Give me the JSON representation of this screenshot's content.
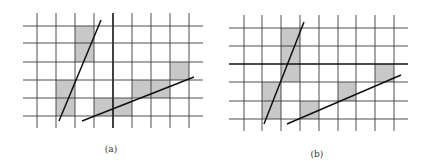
{
  "colors": {
    "grid": "#3a3a3a",
    "shade": "#c8c8c8",
    "line": "#111111"
  },
  "panels": [
    {
      "id": "a",
      "label": "(a)",
      "label_pos": [
        111,
        146
      ],
      "vlines": [
        37,
        56,
        75,
        94,
        113,
        132,
        151,
        170,
        189
      ],
      "vline_range": [
        13,
        128
      ],
      "hlines": [
        26,
        43,
        62,
        80,
        98,
        116
      ],
      "hline_range": [
        23,
        203
      ],
      "thick_vline": 113,
      "thick_hline": null,
      "shaded_cells": [
        [
          75,
          26,
          19,
          36
        ],
        [
          56,
          80,
          19,
          36
        ],
        [
          94,
          98,
          38,
          18
        ],
        [
          132,
          80,
          38,
          18
        ],
        [
          170,
          62,
          19,
          18
        ]
      ],
      "lines": [
        [
          59,
          121,
          101,
          20
        ],
        [
          82,
          121,
          194,
          77
        ]
      ]
    },
    {
      "id": "b",
      "label": "(b)",
      "label_pos": [
        317,
        151
      ],
      "vlines": [
        244,
        262,
        281,
        300,
        319,
        338,
        356,
        375,
        394
      ],
      "vline_range": [
        15,
        131
      ],
      "hlines": [
        28,
        46,
        64,
        82,
        101,
        119
      ],
      "hline_range": [
        229,
        408
      ],
      "thick_vline": null,
      "thick_hline": 64,
      "shaded_cells": [
        [
          281,
          28,
          19,
          54
        ],
        [
          262,
          82,
          19,
          37
        ],
        [
          300,
          101,
          19,
          18
        ],
        [
          338,
          82,
          18,
          19
        ],
        [
          375,
          64,
          19,
          18
        ]
      ],
      "lines": [
        [
          264,
          124,
          304,
          22
        ],
        [
          287,
          124,
          401,
          75
        ]
      ]
    }
  ]
}
